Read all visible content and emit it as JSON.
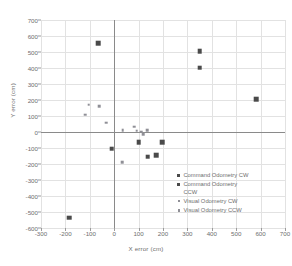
{
  "chart_data": {
    "type": "scatter",
    "title": "",
    "xlabel": "X error (cm)",
    "ylabel": "Y error (cm)",
    "xlim": [
      -300,
      700
    ],
    "ylim": [
      -600,
      700
    ],
    "xticks": [
      -300,
      -200,
      -100,
      0,
      100,
      200,
      300,
      400,
      500,
      600,
      700
    ],
    "yticks": [
      -600,
      -500,
      -400,
      -300,
      -200,
      -100,
      0,
      100,
      200,
      300,
      400,
      500,
      600,
      700
    ],
    "grid": true,
    "legend_position": "lower-right-inside",
    "series": [
      {
        "name": "Command Odometry CW",
        "marker": "square",
        "color": "#4a4a4a",
        "points": [
          [
            -65,
            555
          ],
          [
            350,
            505
          ],
          [
            350,
            403
          ],
          [
            583,
            205
          ]
        ]
      },
      {
        "name": "Command Odometry CCW",
        "marker": "square",
        "color": "#4a4a4a",
        "points": [
          [
            -11,
            -104
          ],
          [
            100,
            -65
          ],
          [
            196,
            -65
          ],
          [
            137,
            -155
          ],
          [
            172,
            -145
          ],
          [
            -185,
            -535
          ]
        ]
      },
      {
        "name": "Visual Odometry CW",
        "marker": "small-square",
        "color": "#8f8f96",
        "points": [
          [
            -120,
            108
          ],
          [
            -105,
            170
          ],
          [
            -62,
            162
          ],
          [
            -32,
            58
          ],
          [
            35,
            13
          ],
          [
            82,
            33
          ]
        ]
      },
      {
        "name": "Visual Odometry CCW",
        "marker": "small-square",
        "color": "#8f8f96",
        "points": [
          [
            92,
            8
          ],
          [
            110,
            2
          ],
          [
            118,
            -12
          ],
          [
            136,
            13
          ],
          [
            33,
            -190
          ]
        ]
      }
    ]
  },
  "legend": {
    "entries": [
      {
        "label": "Command Odometry CW",
        "marker": "cmd"
      },
      {
        "label": "Command Odometry\nCCW",
        "marker": "cmd"
      },
      {
        "label": "Visual Odometry CW",
        "marker": "vis"
      },
      {
        "label": "Visual Odometry CCW",
        "marker": "vis"
      }
    ]
  }
}
